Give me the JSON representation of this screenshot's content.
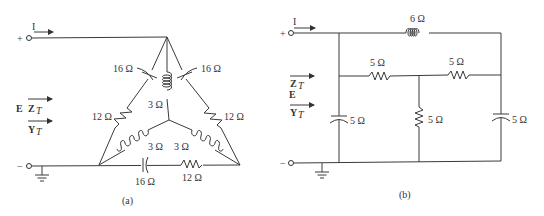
{
  "figure": {
    "panels": [
      {
        "id": "a",
        "caption": "(a)",
        "source": {
          "plus": "+",
          "minus": "−",
          "current": "I",
          "voltage": "E",
          "impedance": "Z",
          "impedance_sub": "T",
          "admittance": "Y",
          "admittance_sub": "T"
        },
        "delta": {
          "left_cap": "16 Ω",
          "right_cap": "16 Ω",
          "bottom_cap": "16 Ω",
          "left_res": "12 Ω",
          "right_res": "12 Ω",
          "bottom_res": "12 Ω"
        },
        "wye": {
          "top_ind": "3 Ω",
          "left_ind": "3 Ω",
          "right_ind": "3 Ω"
        }
      },
      {
        "id": "b",
        "caption": "(b)",
        "source": {
          "plus": "+",
          "minus": "−",
          "current": "I",
          "voltage": "E",
          "impedance": "Z",
          "impedance_sub": "T",
          "admittance": "Y",
          "admittance_sub": "T"
        },
        "elements": {
          "top_ind": "6 Ω",
          "mid_left_res": "5 Ω",
          "mid_right_res": "5 Ω",
          "left_cap": "5 Ω",
          "center_res": "5 Ω",
          "right_cap": "5 Ω"
        }
      }
    ]
  }
}
